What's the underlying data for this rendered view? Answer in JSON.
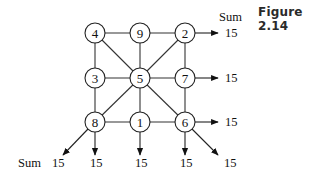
{
  "figure_label": "Figure 2.14",
  "grid": {
    "rows": [
      [
        "4",
        "9",
        "2"
      ],
      [
        "3",
        "5",
        "7"
      ],
      [
        "8",
        "1",
        "6"
      ]
    ]
  },
  "nodes": [
    {
      "id": "n4",
      "label": "4",
      "cx": 95,
      "cy": 33
    },
    {
      "id": "n9",
      "label": "9",
      "cx": 140,
      "cy": 33
    },
    {
      "id": "n2",
      "label": "2",
      "cx": 185,
      "cy": 33
    },
    {
      "id": "n3",
      "label": "3",
      "cx": 95,
      "cy": 78
    },
    {
      "id": "n5",
      "label": "5",
      "cx": 140,
      "cy": 78
    },
    {
      "id": "n7",
      "label": "7",
      "cx": 185,
      "cy": 78
    },
    {
      "id": "n8",
      "label": "8",
      "cx": 95,
      "cy": 122
    },
    {
      "id": "n1",
      "label": "1",
      "cx": 140,
      "cy": 122
    },
    {
      "id": "n6",
      "label": "6",
      "cx": 185,
      "cy": 122
    }
  ],
  "edges": [
    [
      "n4",
      "n9"
    ],
    [
      "n9",
      "n2"
    ],
    [
      "n3",
      "n5"
    ],
    [
      "n5",
      "n7"
    ],
    [
      "n8",
      "n1"
    ],
    [
      "n1",
      "n6"
    ],
    [
      "n4",
      "n3"
    ],
    [
      "n3",
      "n8"
    ],
    [
      "n9",
      "n5"
    ],
    [
      "n5",
      "n1"
    ],
    [
      "n2",
      "n7"
    ],
    [
      "n7",
      "n6"
    ],
    [
      "n4",
      "n5"
    ],
    [
      "n5",
      "n6"
    ],
    [
      "n2",
      "n5"
    ],
    [
      "n5",
      "n8"
    ]
  ],
  "sum_labels": {
    "top_right_heading": "Sum",
    "bottom_left_heading": "Sum",
    "row_sums": [
      "15",
      "15",
      "15"
    ],
    "column_sums": [
      "15",
      "15",
      "15"
    ],
    "diagonal_sums": [
      "15",
      "15"
    ]
  }
}
